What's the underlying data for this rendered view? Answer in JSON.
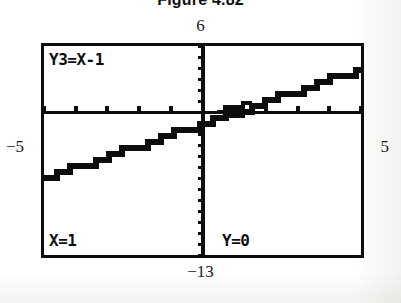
{
  "figure": {
    "caption": "Figure 4.82"
  },
  "window_labels": {
    "ymax": "6",
    "xmin": "−5",
    "xmax": "5",
    "ymin": "−13"
  },
  "calculator": {
    "equation_label": "Y3=X-1",
    "trace_x_readout": "X=1",
    "trace_y_readout": "Y=0"
  },
  "colors": {
    "ink": "#0d0d0d",
    "screen_background": "#ffffff",
    "page_background": "#fdfdfd"
  },
  "chart_data": {
    "type": "line",
    "title": "Figure 4.82",
    "subtitle": "Graphing calculator TRACE screen",
    "xlabel": "",
    "ylabel": "",
    "xlim": [
      -5,
      5
    ],
    "ylim": [
      -13,
      6
    ],
    "grid": false,
    "legend": "none",
    "axes": {
      "x_axis_at_y": 0,
      "y_axis_at_x": 0,
      "x_tick_step": 1,
      "y_tick_step": 1
    },
    "series": [
      {
        "name": "Y3=X-1",
        "expression": "y = x - 1",
        "slope": 1,
        "intercept": -1,
        "x": [
          -5,
          -4,
          -3,
          -2,
          -1,
          0,
          1,
          2,
          3,
          4,
          5
        ],
        "values": [
          -6,
          -5,
          -4,
          -3,
          -2,
          -1,
          0,
          1,
          2,
          3,
          4
        ]
      }
    ],
    "annotations": [
      {
        "name": "trace-cursor",
        "label": "X=1  Y=0",
        "x": 1,
        "y": 0
      }
    ]
  }
}
